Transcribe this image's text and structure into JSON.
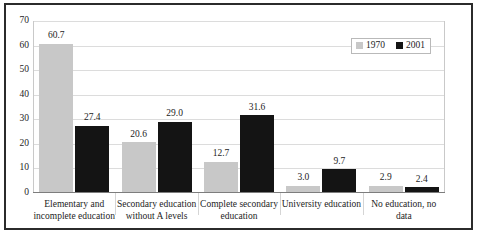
{
  "chart_data": {
    "type": "bar",
    "title": "",
    "subtitle": "",
    "xlabel": "",
    "ylabel": "",
    "ylim": [
      0,
      70
    ],
    "yticks": [
      0,
      10,
      20,
      30,
      40,
      50,
      60,
      70
    ],
    "ytick_labels": [
      "0",
      "10",
      "20",
      "30",
      "40",
      "50",
      "60",
      "70"
    ],
    "grid": true,
    "grid_axis": "y",
    "legend_position": "top-right",
    "categories": [
      "Elementary and incomplete  education",
      "Secondary education without A levels",
      "Complete secondary education",
      "University education",
      "No education, no data"
    ],
    "category_lines": [
      [
        "Elementary and",
        "incomplete  education"
      ],
      [
        "Secondary education",
        "without A levels"
      ],
      [
        "Complete secondary",
        "education"
      ],
      [
        "University education"
      ],
      [
        "No education, no data"
      ]
    ],
    "series": [
      {
        "name": "1970",
        "color": "#c8c8c8",
        "values": [
          60.7,
          20.6,
          12.7,
          3.0,
          2.9
        ],
        "value_labels": [
          "60.7",
          "20.6",
          "12.7",
          "3.0",
          "2.9"
        ]
      },
      {
        "name": "2001",
        "color": "#141414",
        "values": [
          27.4,
          29.0,
          31.6,
          9.7,
          2.4
        ],
        "value_labels": [
          "27.4",
          "29.0",
          "31.6",
          "9.7",
          "2.4"
        ]
      }
    ]
  },
  "legend": {
    "items": [
      {
        "label": "1970",
        "color": "#c8c8c8"
      },
      {
        "label": "2001",
        "color": "#141414"
      }
    ]
  }
}
